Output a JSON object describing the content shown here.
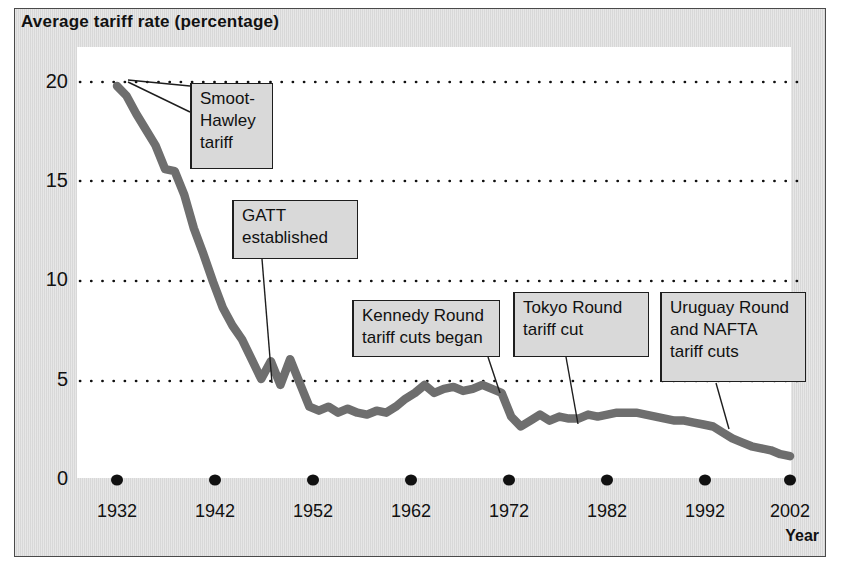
{
  "figure": {
    "title": "Average tariff rate (percentage)",
    "axis_title_x": "Year"
  },
  "chart_data": {
    "type": "line",
    "title": "Average tariff rate (percentage)",
    "xlabel": "Year",
    "ylabel": "Average tariff rate (percentage)",
    "xlim": [
      1932,
      2002
    ],
    "ylim": [
      0,
      20
    ],
    "yticks": [
      0,
      5,
      10,
      15,
      20
    ],
    "ytick_labels": [
      "0",
      "5",
      "10",
      "15",
      "20"
    ],
    "xticks": [
      1932,
      1942,
      1952,
      1962,
      1972,
      1982,
      1992,
      2002
    ],
    "xtick_labels": [
      "1932",
      "1942",
      "1952",
      "1962",
      "1972",
      "1982",
      "1992",
      "2002"
    ],
    "grid": "horizontal-dotted",
    "legend": "none",
    "line_color": "#6e6e6e",
    "series": [
      {
        "name": "Average tariff rate",
        "x": [
          1932,
          1933,
          1934,
          1935,
          1936,
          1937,
          1938,
          1939,
          1940,
          1941,
          1942,
          1943,
          1944,
          1945,
          1946,
          1947,
          1948,
          1949,
          1950,
          1951,
          1952,
          1953,
          1954,
          1955,
          1956,
          1957,
          1958,
          1959,
          1960,
          1961,
          1962,
          1963,
          1964,
          1965,
          1966,
          1967,
          1968,
          1969,
          1970,
          1971,
          1972,
          1973,
          1974,
          1975,
          1976,
          1977,
          1978,
          1979,
          1980,
          1981,
          1982,
          1983,
          1984,
          1985,
          1986,
          1987,
          1988,
          1989,
          1990,
          1991,
          1992,
          1993,
          1994,
          1995,
          1996,
          1997,
          1998,
          1999,
          2000,
          2001,
          2002
        ],
        "y": [
          19.8,
          19.3,
          18.4,
          17.6,
          16.8,
          15.6,
          15.5,
          14.3,
          12.6,
          11.3,
          9.9,
          8.6,
          7.7,
          7.0,
          6.0,
          5.0,
          5.9,
          4.7,
          6.0,
          4.8,
          3.6,
          3.4,
          3.6,
          3.3,
          3.5,
          3.3,
          3.2,
          3.4,
          3.3,
          3.6,
          4.0,
          4.3,
          4.7,
          4.3,
          4.5,
          4.6,
          4.4,
          4.5,
          4.7,
          4.5,
          4.3,
          3.1,
          2.6,
          2.9,
          3.2,
          2.9,
          3.1,
          3.0,
          3.0,
          3.2,
          3.1,
          3.2,
          3.3,
          3.3,
          3.3,
          3.2,
          3.1,
          3.0,
          2.9,
          2.9,
          2.8,
          2.7,
          2.6,
          2.3,
          2.0,
          1.8,
          1.6,
          1.5,
          1.4,
          1.2,
          1.1
        ]
      }
    ],
    "annotations": [
      {
        "id": "smoot-hawley",
        "lines": [
          "Smoot-",
          "Hawley",
          "tariff"
        ],
        "points_to_year": 1932,
        "points_to_value": 19.8
      },
      {
        "id": "gatt-established",
        "lines": [
          "GATT",
          "established"
        ],
        "points_to_year": 1947,
        "points_to_value": 5.0
      },
      {
        "id": "kennedy-round",
        "lines": [
          "Kennedy Round",
          "tariff cuts began"
        ],
        "points_to_year": 1968,
        "points_to_value": 4.4
      },
      {
        "id": "tokyo-round",
        "lines": [
          "Tokyo Round",
          "tariff cut"
        ],
        "points_to_year": 1980,
        "points_to_value": 3.0
      },
      {
        "id": "uruguay-round-nafta",
        "lines": [
          "Uruguay Round",
          "and NAFTA",
          "tariff cuts"
        ],
        "points_to_year": 1994,
        "points_to_value": 2.6
      }
    ]
  },
  "y_axis": {
    "ticks": [
      {
        "label": "20",
        "top": 70
      },
      {
        "label": "15",
        "top": 169
      },
      {
        "label": "10",
        "top": 268
      },
      {
        "label": "5",
        "top": 368
      },
      {
        "label": "0",
        "top": 467
      }
    ]
  },
  "x_axis": {
    "title": "Year",
    "ticks": [
      {
        "label": "1932",
        "left": 112
      },
      {
        "label": "1942",
        "left": 212
      },
      {
        "label": "1952",
        "left": 310
      },
      {
        "label": "1962",
        "left": 408
      },
      {
        "label": "1972",
        "left": 505
      },
      {
        "label": "1982",
        "left": 603
      },
      {
        "label": "1992",
        "left": 702
      },
      {
        "label": "2002",
        "left": 790
      }
    ]
  },
  "callouts": {
    "smoot_hawley": {
      "lines": [
        "Smoot-",
        "Hawley",
        "tariff"
      ],
      "left": 190,
      "top": 83,
      "width": 83,
      "height": 86
    },
    "gatt": {
      "lines": [
        "GATT",
        "established"
      ],
      "left": 232,
      "top": 200,
      "width": 126,
      "height": 59
    },
    "kennedy": {
      "lines": [
        "Kennedy Round",
        "tariff cuts began"
      ],
      "left": 352,
      "top": 300,
      "width": 148,
      "height": 57
    },
    "tokyo": {
      "lines": [
        "Tokyo Round",
        "tariff cut"
      ],
      "left": 513,
      "top": 292,
      "width": 136,
      "height": 65
    },
    "uruguay": {
      "lines": [
        "Uruguay Round",
        "and NAFTA",
        "tariff cuts"
      ],
      "left": 660,
      "top": 292,
      "width": 146,
      "height": 90
    }
  },
  "colors": {
    "line": "#6e6e6e",
    "panel_background": "#dcdcdc",
    "plot_background": "#ffffff",
    "text": "#111111",
    "callout_background": "#d9d9d9",
    "callout_border": "#1e1e1e"
  }
}
